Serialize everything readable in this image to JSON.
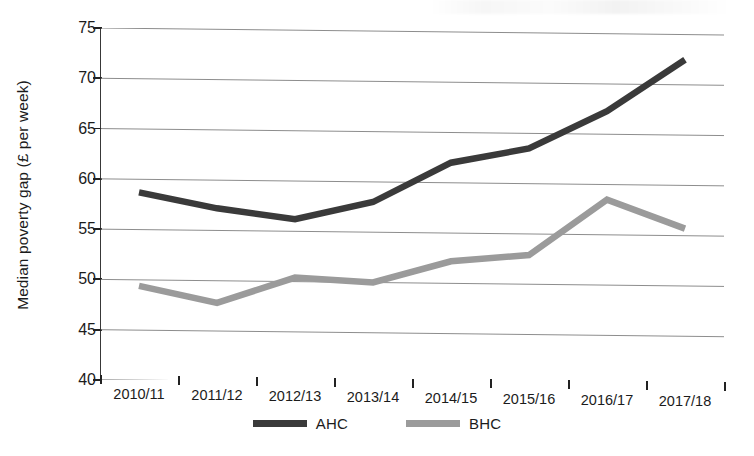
{
  "chart_data": {
    "type": "line",
    "title": "",
    "subtitle": "",
    "xlabel": "",
    "ylabel": "Median poverty gap (£ per week)",
    "categories": [
      "2010/11",
      "2011/12",
      "2012/13",
      "2013/14",
      "2014/15",
      "2015/16",
      "2016/17",
      "2017/18"
    ],
    "series": [
      {
        "name": "AHC",
        "color": "#3a3a3a",
        "values": [
          58.7,
          57.2,
          56.2,
          58.0,
          62.0,
          63.5,
          67.3,
          72.5
        ]
      },
      {
        "name": "BHC",
        "color": "#9b9b9b",
        "values": [
          49.4,
          47.8,
          50.4,
          50.0,
          52.2,
          52.9,
          58.5,
          55.7
        ]
      }
    ],
    "ylim": [
      40,
      75
    ],
    "yticks": [
      40,
      45,
      50,
      55,
      60,
      65,
      70,
      75
    ],
    "ytick_labels": [
      "40",
      "45",
      "50",
      "55",
      "60",
      "65",
      "70",
      "75"
    ],
    "grid": "horizontal",
    "legend_position": "bottom",
    "axis_color": "#222222",
    "grid_color": "#8d8d8d",
    "background": "#ffffff"
  },
  "legend": {
    "items": [
      {
        "label": "AHC",
        "color": "#3a3a3a"
      },
      {
        "label": "BHC",
        "color": "#9b9b9b"
      }
    ]
  }
}
